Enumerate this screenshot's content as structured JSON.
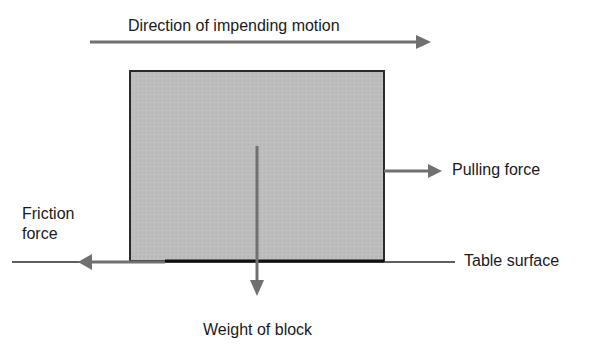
{
  "diagram": {
    "labels": {
      "motion": "Direction of impending motion",
      "pulling_force": "Pulling force",
      "friction_line1": "Friction",
      "friction_line2": "force",
      "table_surface": "Table surface",
      "weight": "Weight of block"
    },
    "colors": {
      "block_fill": "#bdbdbd",
      "block_border": "#2a2a2a",
      "arrow": "#707070",
      "line": "#2a2a2a",
      "text": "#1a1a1a"
    }
  }
}
